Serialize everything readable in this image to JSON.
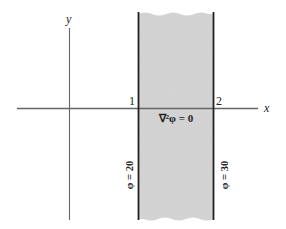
{
  "diagram": {
    "axes": {
      "x_label": "x",
      "y_label": "y"
    },
    "boundaries": [
      {
        "id": "1",
        "label": "1",
        "condition": "φ = 20"
      },
      {
        "id": "2",
        "label": "2",
        "condition": "φ = 30"
      }
    ],
    "region_equation": "∇²φ = 0",
    "colors": {
      "region_fill": "#d4d4d4",
      "lines": "#222222",
      "axes": "#666666",
      "background": "#ffffff"
    }
  }
}
